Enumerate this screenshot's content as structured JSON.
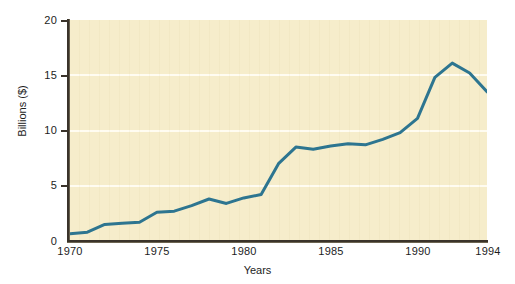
{
  "chart_data": {
    "type": "line",
    "title": "",
    "subtitle": "",
    "xlabel": "Years",
    "ylabel": "Billions ($)",
    "xlim": [
      1970,
      1994
    ],
    "ylim": [
      0,
      20
    ],
    "grid": true,
    "legend": null,
    "legend_position": "none",
    "x_tick_labels": [
      "1970",
      "1975",
      "1980",
      "1985",
      "1990",
      "1994"
    ],
    "x_tick_values": [
      1970,
      1975,
      1980,
      1985,
      1990,
      1994
    ],
    "y_tick_labels": [
      "0",
      "5",
      "10",
      "15",
      "20"
    ],
    "y_tick_values": [
      0,
      5,
      10,
      15,
      20
    ],
    "x": [
      1970,
      1971,
      1972,
      1973,
      1974,
      1975,
      1976,
      1977,
      1978,
      1979,
      1980,
      1981,
      1982,
      1983,
      1984,
      1985,
      1986,
      1987,
      1988,
      1989,
      1990,
      1991,
      1992,
      1993,
      1994
    ],
    "series": [
      {
        "name": "Billions ($)",
        "color": "#2d7590",
        "line_width": 3,
        "values": [
          0.65,
          0.8,
          1.5,
          1.6,
          1.7,
          2.6,
          2.7,
          3.2,
          3.8,
          3.4,
          3.9,
          4.2,
          7.0,
          8.5,
          8.3,
          8.6,
          8.8,
          8.7,
          9.2,
          9.8,
          11.1,
          14.8,
          16.1,
          15.2,
          13.5
        ]
      }
    ]
  },
  "style": {
    "plot_background": "#f6edcb",
    "gridline_color": "#fffdf2",
    "axis_color": "#3a332a",
    "line_color": "#2d7590",
    "page_background": "#ffffff",
    "text_color": "#1d1d1d"
  }
}
